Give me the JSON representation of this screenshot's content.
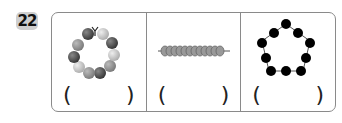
{
  "question": {
    "number": "22"
  },
  "cells": [
    {
      "name": "bead-ring-with-bow",
      "bead_count": 11,
      "open_paren": "(",
      "close_paren": ")"
    },
    {
      "name": "beads-on-string-side-view",
      "bead_count": 12,
      "open_paren": "(",
      "close_paren": ")"
    },
    {
      "name": "black-bead-pentagon",
      "bead_count": 10,
      "open_paren": "(",
      "close_paren": ")"
    }
  ],
  "colors": {
    "border": "#8a8a8a",
    "badge": "#cfcfcf",
    "dark_bead": "#4a4a4a",
    "mid_bead": "#8c8c8c",
    "light_bead": "#c8c8c8",
    "black_bead": "#000000"
  }
}
